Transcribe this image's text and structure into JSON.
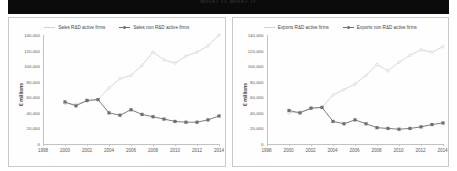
{
  "banner": {
    "title": "WHAT IT WHAT IT"
  },
  "common": {
    "ylabel": "€ millions",
    "yticks": [
      "0",
      "20,000",
      "40,000",
      "60,000",
      "80,000",
      "100,000",
      "120,000",
      "140,000"
    ],
    "xticks": [
      "1998",
      "2000",
      "2002",
      "2004",
      "2006",
      "2008",
      "2010",
      "2012",
      "2014"
    ],
    "color_rd": "#d2d2d2",
    "color_nonrd": "#6f6f6f"
  },
  "chart_data": [
    {
      "id": "sales",
      "type": "line",
      "title": "",
      "xlabel": "",
      "ylabel": "€ millions",
      "xlim": [
        1998,
        2014
      ],
      "ylim": [
        0,
        140000
      ],
      "grid": false,
      "legend_position": "top-center",
      "x": [
        2000,
        2001,
        2002,
        2003,
        2004,
        2005,
        2006,
        2007,
        2008,
        2009,
        2010,
        2011,
        2012,
        2013,
        2014
      ],
      "series": [
        {
          "name": "Sales R&D active firms",
          "marker": "line",
          "values": [
            52000,
            51000,
            55000,
            57000,
            72000,
            84000,
            88000,
            101000,
            118000,
            108000,
            104000,
            113000,
            118000,
            126000,
            140000
          ]
        },
        {
          "name": "Sales non R&D active firms",
          "marker": "square",
          "values": [
            54000,
            49000,
            56000,
            57000,
            40000,
            37000,
            44000,
            38000,
            35000,
            32000,
            29000,
            28000,
            28000,
            31000,
            36000
          ]
        }
      ]
    },
    {
      "id": "exports",
      "type": "line",
      "title": "",
      "xlabel": "",
      "ylabel": "€ millions",
      "xlim": [
        1998,
        2014
      ],
      "ylim": [
        0,
        140000
      ],
      "grid": false,
      "legend_position": "top-center",
      "x": [
        2000,
        2001,
        2002,
        2003,
        2004,
        2005,
        2006,
        2007,
        2008,
        2009,
        2010,
        2011,
        2012,
        2013,
        2014
      ],
      "series": [
        {
          "name": "Exports R&D active firms",
          "marker": "line",
          "values": [
            40000,
            41000,
            46000,
            47000,
            63000,
            70000,
            77000,
            88000,
            102000,
            94000,
            105000,
            114000,
            121000,
            118000,
            125000
          ]
        },
        {
          "name": "Exports non R&D active firms",
          "marker": "square",
          "values": [
            43000,
            40000,
            46000,
            47000,
            29000,
            26000,
            31000,
            26000,
            21000,
            20000,
            19000,
            20000,
            22000,
            25000,
            27000
          ]
        }
      ]
    }
  ]
}
